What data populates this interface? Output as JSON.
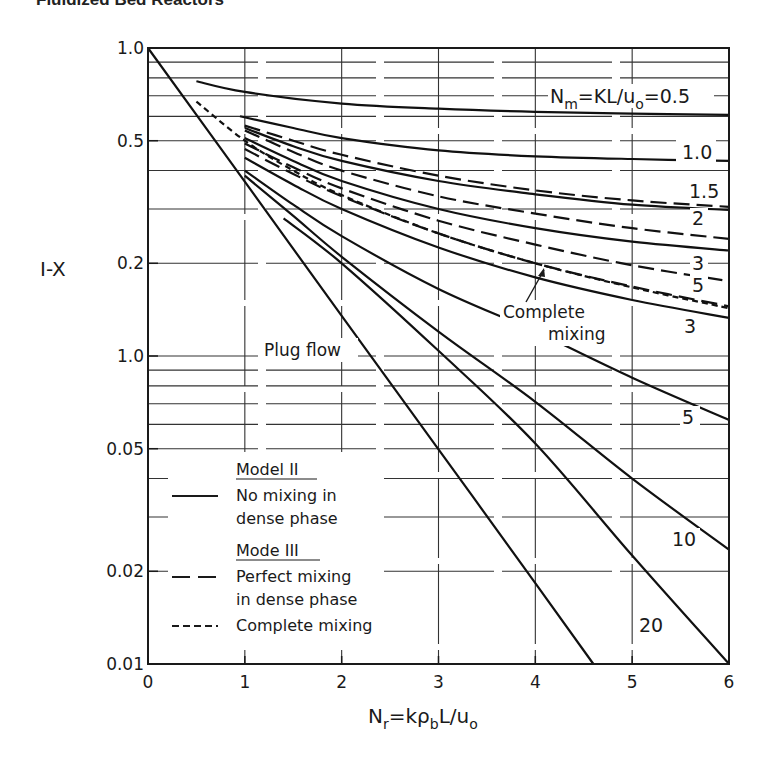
{
  "page": {
    "header": "Fluidized Bed Reactors"
  },
  "chart_data": {
    "type": "line",
    "title": "",
    "xlabel": "N_r = kρ_b L / u_o",
    "xlabel_parts": {
      "main": "N",
      "sub": "r",
      "rest1": "=kρ",
      "sub2": "b",
      "rest2": "L/u",
      "sub3": "o"
    },
    "ylabel": "1-X",
    "ylabel_display": "I-X",
    "x_scale": "linear",
    "y_scale": "log",
    "xlim": [
      0,
      6
    ],
    "ylim": [
      0.01,
      1.0
    ],
    "grid": true,
    "x_ticks": [
      0,
      1,
      2,
      3,
      4,
      5,
      6
    ],
    "x_tick_labels": [
      "0",
      "1",
      "2",
      "3",
      "4",
      "5",
      "6"
    ],
    "y_ticks": [
      1.0,
      0.5,
      0.2,
      0.1,
      0.05,
      0.02,
      0.01
    ],
    "y_tick_labels": [
      "1.0",
      "0.5",
      "0.2",
      "1.0",
      "0.05",
      "0.02",
      "0.01"
    ],
    "y_minor_gridlines": [
      0.9,
      0.8,
      0.7,
      0.6,
      0.4,
      0.3,
      0.09,
      0.08,
      0.07,
      0.06,
      0.04,
      0.03
    ],
    "parameter_label": "N_m=KL/u_o=0.5",
    "parameter_label_parts": {
      "a": "N",
      "sub": "m",
      "b": "=KL/u",
      "sub2": "o",
      "c": "=0.5"
    },
    "annotations": {
      "plug_flow": "Plug flow",
      "complete_mixing_line1": "Complete",
      "complete_mixing_line2": "mixing"
    },
    "legend": {
      "placement": "lower-left",
      "model2_title": "Model II",
      "model2_desc1": "No mixing in",
      "model2_desc2": "dense phase",
      "model3_title": "Mode III",
      "model3_desc1": "Perfect mixing",
      "model3_desc2": "in dense phase",
      "complete_desc": "Complete mixing"
    },
    "series": [
      {
        "name": "Plug flow",
        "style": "solid",
        "label": "",
        "x": [
          0,
          1,
          2,
          3,
          4,
          4.6
        ],
        "y": [
          1.0,
          0.368,
          0.135,
          0.0498,
          0.0183,
          0.01
        ]
      },
      {
        "name": "Model II Nm=0.5",
        "style": "solid",
        "label": "",
        "x": [
          0.5,
          1,
          2,
          3,
          4,
          5,
          6
        ],
        "y": [
          0.78,
          0.72,
          0.66,
          0.635,
          0.62,
          0.612,
          0.607
        ]
      },
      {
        "name": "Model II Nm=1.0",
        "style": "solid",
        "label": "1.0",
        "x": [
          0.95,
          1.5,
          2,
          3,
          4,
          5,
          6
        ],
        "y": [
          0.6,
          0.55,
          0.51,
          0.465,
          0.445,
          0.436,
          0.43
        ]
      },
      {
        "name": "Model III Nm=1.5",
        "style": "dashed",
        "label": "1.5",
        "x": [
          1,
          1.5,
          2,
          3,
          4,
          5,
          6
        ],
        "y": [
          0.56,
          0.5,
          0.45,
          0.385,
          0.345,
          0.32,
          0.305
        ]
      },
      {
        "name": "Model II Nm=1.5",
        "style": "solid",
        "label": "",
        "x": [
          1,
          1.5,
          2,
          3,
          4,
          5,
          6
        ],
        "y": [
          0.55,
          0.48,
          0.43,
          0.37,
          0.335,
          0.31,
          0.298
        ]
      },
      {
        "name": "Model III Nm=2",
        "style": "dashed",
        "label": "2",
        "x": [
          1,
          1.5,
          2,
          3,
          4,
          5,
          6
        ],
        "y": [
          0.54,
          0.46,
          0.4,
          0.33,
          0.29,
          0.26,
          0.24
        ]
      },
      {
        "name": "Model II Nm=2",
        "style": "solid",
        "label": "",
        "x": [
          1,
          1.5,
          2,
          3,
          4,
          5,
          6
        ],
        "y": [
          0.51,
          0.43,
          0.37,
          0.3,
          0.26,
          0.235,
          0.22
        ]
      },
      {
        "name": "Model III Nm=3",
        "style": "dashed",
        "label": "3",
        "x": [
          1,
          1.5,
          2,
          3,
          4,
          5,
          6
        ],
        "y": [
          0.49,
          0.41,
          0.35,
          0.275,
          0.23,
          0.197,
          0.175
        ]
      },
      {
        "name": "Model III Nm=5",
        "style": "dashed",
        "label": "5",
        "x": [
          1,
          1.5,
          2,
          3,
          4,
          5,
          6
        ],
        "y": [
          0.47,
          0.39,
          0.33,
          0.25,
          0.2,
          0.168,
          0.145
        ]
      },
      {
        "name": "Complete mixing",
        "style": "dotted",
        "label": "",
        "x": [
          0.5,
          1,
          1.5,
          2,
          3,
          4,
          5,
          6
        ],
        "y": [
          0.67,
          0.5,
          0.4,
          0.333,
          0.25,
          0.2,
          0.167,
          0.143
        ]
      },
      {
        "name": "Model II Nm=3",
        "style": "solid",
        "label": "3",
        "x": [
          1,
          1.5,
          2,
          3,
          4,
          5,
          6
        ],
        "y": [
          0.44,
          0.36,
          0.3,
          0.225,
          0.18,
          0.152,
          0.133
        ]
      },
      {
        "name": "Model II Nm=5",
        "style": "solid",
        "label": "5",
        "x": [
          1,
          1.5,
          2,
          3,
          4,
          5,
          6
        ],
        "y": [
          0.4,
          0.31,
          0.245,
          0.165,
          0.12,
          0.085,
          0.062
        ]
      },
      {
        "name": "Model II Nm=10",
        "style": "solid",
        "label": "10",
        "x": [
          1,
          1.5,
          2,
          3,
          4,
          5,
          6
        ],
        "y": [
          0.385,
          0.285,
          0.21,
          0.12,
          0.071,
          0.04,
          0.0235
        ]
      },
      {
        "name": "Model II Nm=20",
        "style": "solid",
        "label": "20",
        "x": [
          1.4,
          2,
          3,
          4,
          5,
          6
        ],
        "y": [
          0.28,
          0.2,
          0.104,
          0.052,
          0.0225,
          0.01
        ]
      }
    ]
  }
}
